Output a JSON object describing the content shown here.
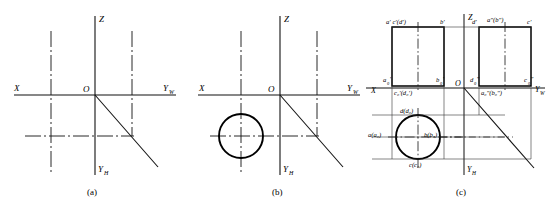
{
  "figure": {
    "panel_count": 3,
    "colors": {
      "line": "#000000",
      "thin_line": "#222222",
      "background": "#ffffff"
    }
  },
  "panels": [
    {
      "id": "a",
      "caption": "(a)",
      "axes": {
        "x": "X",
        "yw": "Y",
        "yw_sub": "W",
        "yh": "Y",
        "yh_sub": "H",
        "z": "Z",
        "origin": "O"
      },
      "elements": [
        "vertical-center-dashdot-left",
        "vertical-center-dashdot-right",
        "horizontal-center-dashdot",
        "miter-line-45"
      ]
    },
    {
      "id": "b",
      "caption": "(b)",
      "axes": {
        "x": "X",
        "yw": "Y",
        "yw_sub": "W",
        "yh": "Y",
        "yh_sub": "H",
        "z": "Z",
        "origin": "O"
      },
      "elements": [
        "circle-top-view",
        "vertical-center-dashdot-left",
        "vertical-center-dashdot-right",
        "horizontal-center-dashdot",
        "miter-line-45"
      ]
    },
    {
      "id": "c",
      "caption": "(c)",
      "axes": {
        "x": "X",
        "yw": "Y",
        "yw_sub": "W",
        "yh": "Y",
        "yh_sub": "H",
        "z": "Z",
        "origin": "O"
      },
      "elements": [
        "front-view-rectangle",
        "side-view-rectangle",
        "circle-top-view",
        "miter-line-45",
        "projection-lines"
      ],
      "labels": {
        "front_top_left": "a′ c′(d′)",
        "front_top_right": "b′",
        "side_top_left": "d′",
        "side_top_mid": "a″(b″)",
        "side_top_right": "c′",
        "front_bottom_left": "a",
        "front_bottom_left_sub": "0",
        "front_bottom_left_prime": "′",
        "front_bottom_right": "b",
        "front_bottom_right_sub": "0",
        "front_bottom_right_prime": "′",
        "front_axis_label": "c₀′(d₀′)",
        "side_bottom_left": "d",
        "side_bottom_left_sub": "0",
        "side_bottom_left_prime": "″",
        "side_axis_label": "a₀″(b₀″)",
        "side_bottom_right": "c",
        "side_bottom_right_sub": "0",
        "side_bottom_right_prime": "″",
        "top_left": "a(a₀)",
        "top_right": "b(b₀)",
        "top_upper": "d(d₀)",
        "top_lower": "c(c₀)"
      }
    }
  ]
}
